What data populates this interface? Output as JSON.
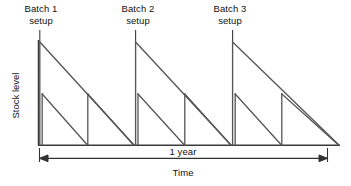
{
  "figure": {
    "title_internal": "Stock level over time with batch setups",
    "axes": {
      "y_label": "Stock level",
      "x_label": "Time",
      "y_axis_x": 38,
      "x_axis_y": 145,
      "x_axis_start": 38,
      "x_axis_end": 340,
      "y_axis_top": 40,
      "axis_color": "#404040",
      "axis_width": 1.4
    },
    "annotations": [
      {
        "id": "batch1",
        "label": "Batch 1\nsetup",
        "leader_from_x": 41,
        "leader_from_y": 28,
        "peak_x": 39,
        "peak_y": 42
      },
      {
        "id": "batch2",
        "label": "Batch 2\nsetup",
        "leader_from_x": 138,
        "leader_from_y": 28,
        "peak_x": 135,
        "peak_y": 42
      },
      {
        "id": "batch3",
        "label": "Batch 3\nsetup",
        "leader_from_x": 230,
        "leader_from_y": 28,
        "peak_x": 232,
        "peak_y": 42
      }
    ],
    "dimension": {
      "label": "1 year",
      "line_y": 158,
      "start_x": 39,
      "end_x": 327,
      "tick_top_y": 148,
      "color": "#333333"
    },
    "series": {
      "batch_sawtooth": {
        "name": "Batch stock level",
        "color": "#555555",
        "stroke": 1.3,
        "peak_y": 42,
        "baseline_y": 145,
        "cycles": [
          {
            "rise_x": 39,
            "fall_end_x": 135
          },
          {
            "rise_x": 135,
            "fall_end_x": 232
          },
          {
            "rise_x": 232,
            "fall_end_x": 340
          }
        ]
      },
      "order_sawtooth": {
        "name": "Order stock level",
        "color": "#555555",
        "stroke": 1.3,
        "peak_y": 94,
        "baseline_y": 145,
        "cycles": [
          {
            "rise_x": 39,
            "fall_end_x": 88
          },
          {
            "rise_x": 88,
            "fall_end_x": 136
          },
          {
            "rise_x": 136,
            "fall_end_x": 185
          },
          {
            "rise_x": 185,
            "fall_end_x": 233
          },
          {
            "rise_x": 233,
            "fall_end_x": 282
          },
          {
            "rise_x": 282,
            "fall_end_x": 340
          }
        ]
      }
    },
    "colors": {
      "background": "#ffffff",
      "ink": "#111111",
      "line": "#555555",
      "axis": "#3a3a3a"
    }
  }
}
